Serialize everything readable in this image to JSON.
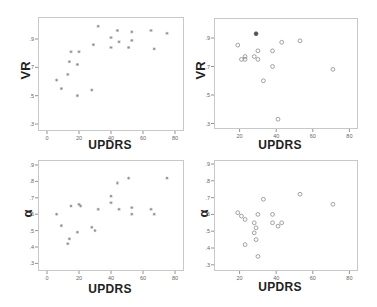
{
  "chart_data": [
    {
      "type": "scatter",
      "panel": "top-left",
      "xlabel": "UPDRS",
      "ylabel": "VR",
      "marker": "asterisk",
      "x_ticks": [
        0,
        20,
        40,
        60,
        80
      ],
      "y_ticks": [
        ".3",
        ".5",
        ".7",
        ".9"
      ],
      "xlim": [
        -6,
        85
      ],
      "ylim": [
        0.26,
        0.99
      ],
      "points": [
        {
          "x": 6,
          "y": 0.61
        },
        {
          "x": 9,
          "y": 0.55
        },
        {
          "x": 13,
          "y": 0.65
        },
        {
          "x": 14,
          "y": 0.74
        },
        {
          "x": 15,
          "y": 0.81
        },
        {
          "x": 19,
          "y": 0.5
        },
        {
          "x": 19,
          "y": 0.72
        },
        {
          "x": 20,
          "y": 0.81
        },
        {
          "x": 28,
          "y": 0.54
        },
        {
          "x": 29,
          "y": 0.86
        },
        {
          "x": 32,
          "y": 0.99
        },
        {
          "x": 40,
          "y": 0.84
        },
        {
          "x": 40,
          "y": 0.91
        },
        {
          "x": 44,
          "y": 0.96
        },
        {
          "x": 45,
          "y": 0.88
        },
        {
          "x": 51,
          "y": 0.84
        },
        {
          "x": 53,
          "y": 0.89
        },
        {
          "x": 53,
          "y": 0.95
        },
        {
          "x": 65,
          "y": 0.96
        },
        {
          "x": 67,
          "y": 0.83
        },
        {
          "x": 75,
          "y": 0.94
        }
      ]
    },
    {
      "type": "scatter",
      "panel": "top-right",
      "xlabel": "UPDRS",
      "ylabel": "VR",
      "marker": "circle",
      "x_ticks": [
        20,
        40,
        60,
        80
      ],
      "y_ticks": [
        ".3",
        ".5",
        ".7",
        ".9"
      ],
      "xlim": [
        6,
        84
      ],
      "ylim": [
        0.27,
        1.04
      ],
      "points": [
        {
          "x": 19,
          "y": 0.85
        },
        {
          "x": 21,
          "y": 0.75
        },
        {
          "x": 23,
          "y": 0.77
        },
        {
          "x": 23,
          "y": 0.75
        },
        {
          "x": 28,
          "y": 0.77
        },
        {
          "x": 29,
          "y": 0.93
        },
        {
          "x": 30,
          "y": 0.81
        },
        {
          "x": 30,
          "y": 0.75
        },
        {
          "x": 33,
          "y": 0.6
        },
        {
          "x": 38,
          "y": 0.81
        },
        {
          "x": 38,
          "y": 0.7
        },
        {
          "x": 41,
          "y": 0.33
        },
        {
          "x": 43,
          "y": 0.87
        },
        {
          "x": 53,
          "y": 0.88
        },
        {
          "x": 71,
          "y": 0.68
        }
      ]
    },
    {
      "type": "scatter",
      "panel": "bottom-left",
      "xlabel": "UPDRS",
      "ylabel": "α",
      "marker": "asterisk",
      "x_ticks": [
        0,
        20,
        40,
        60,
        80
      ],
      "y_ticks": [
        ".3",
        ".4",
        ".5",
        ".6",
        ".7",
        ".8",
        ".9"
      ],
      "xlim": [
        -6,
        85
      ],
      "ylim": [
        0.26,
        0.94
      ],
      "points": [
        {
          "x": 6,
          "y": 0.6
        },
        {
          "x": 9,
          "y": 0.53
        },
        {
          "x": 13,
          "y": 0.42
        },
        {
          "x": 14,
          "y": 0.45
        },
        {
          "x": 15,
          "y": 0.65
        },
        {
          "x": 19,
          "y": 0.49
        },
        {
          "x": 20,
          "y": 0.66
        },
        {
          "x": 21,
          "y": 0.65
        },
        {
          "x": 28,
          "y": 0.52
        },
        {
          "x": 30,
          "y": 0.5
        },
        {
          "x": 32,
          "y": 0.63
        },
        {
          "x": 40,
          "y": 0.71
        },
        {
          "x": 40,
          "y": 0.67
        },
        {
          "x": 44,
          "y": 0.79
        },
        {
          "x": 45,
          "y": 0.63
        },
        {
          "x": 51,
          "y": 0.82
        },
        {
          "x": 53,
          "y": 0.64
        },
        {
          "x": 53,
          "y": 0.6
        },
        {
          "x": 65,
          "y": 0.63
        },
        {
          "x": 67,
          "y": 0.6
        },
        {
          "x": 75,
          "y": 0.82
        }
      ]
    },
    {
      "type": "scatter",
      "panel": "bottom-right",
      "xlabel": "UPDRS",
      "ylabel": "α",
      "marker": "circle",
      "x_ticks": [
        20,
        40,
        60,
        80
      ],
      "y_ticks": [
        ".3",
        ".4",
        ".5",
        ".6",
        ".7",
        ".8",
        ".9"
      ],
      "xlim": [
        6,
        84
      ],
      "ylim": [
        0.26,
        0.94
      ],
      "points": [
        {
          "x": 19,
          "y": 0.61
        },
        {
          "x": 21,
          "y": 0.59
        },
        {
          "x": 23,
          "y": 0.57
        },
        {
          "x": 23,
          "y": 0.42
        },
        {
          "x": 28,
          "y": 0.55
        },
        {
          "x": 28,
          "y": 0.49
        },
        {
          "x": 29,
          "y": 0.52
        },
        {
          "x": 29,
          "y": 0.45
        },
        {
          "x": 30,
          "y": 0.6
        },
        {
          "x": 30,
          "y": 0.35
        },
        {
          "x": 33,
          "y": 0.69
        },
        {
          "x": 38,
          "y": 0.6
        },
        {
          "x": 38,
          "y": 0.55
        },
        {
          "x": 41,
          "y": 0.53
        },
        {
          "x": 43,
          "y": 0.55
        },
        {
          "x": 53,
          "y": 0.72
        },
        {
          "x": 71,
          "y": 0.66
        }
      ]
    }
  ],
  "labels": {
    "tl_y": "VR",
    "tl_x": "UPDRS",
    "tr_y": "VR",
    "tr_x": "UPDRS",
    "bl_y": "α",
    "bl_x": "UPDRS",
    "br_y": "α",
    "br_x": "UPDRS"
  },
  "colors": {
    "frame": "#c8c8c8",
    "marker": "#8a8a8a",
    "marker_dark": "#555555",
    "tick": "#777777"
  }
}
